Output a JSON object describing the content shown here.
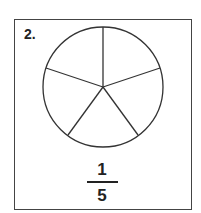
{
  "problem": {
    "number_label": "2.",
    "diagram": {
      "shape": "circle",
      "parts": 5,
      "stroke_color": "#333333"
    },
    "fraction": {
      "numerator": "1",
      "denominator": "5"
    }
  }
}
